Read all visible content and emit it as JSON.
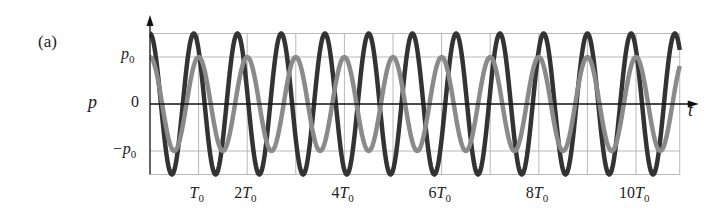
{
  "panel": {
    "label": "(a)"
  },
  "chart_data": {
    "type": "line",
    "title": "",
    "xlabel": "t",
    "ylabel": "p",
    "grid": true,
    "x_unit": "T0",
    "xlim": [
      0,
      10.9
    ],
    "ylim": [
      -1.5,
      1.5
    ],
    "x_ticks": [
      {
        "value": 1,
        "label": "T0"
      },
      {
        "value": 2,
        "label": "2T0"
      },
      {
        "value": 4,
        "label": "4T0"
      },
      {
        "value": 6,
        "label": "6T0"
      },
      {
        "value": 8,
        "label": "8T0"
      },
      {
        "value": 10,
        "label": "10T0"
      }
    ],
    "y_ticks": [
      {
        "value": 1,
        "label": "p0"
      },
      {
        "value": 0,
        "label": "0"
      },
      {
        "value": -1,
        "label": "-p0"
      }
    ],
    "series": [
      {
        "name": "dark wave",
        "color": "#333333",
        "amplitude": 1.5,
        "period": 0.9,
        "phase": 0,
        "formula": "1.5 p0 cos(2*pi*t/(0.9 T0))"
      },
      {
        "name": "light wave",
        "color": "#8a8a8a",
        "amplitude": 1.0,
        "period": 1.0,
        "phase": 0,
        "formula": "p0 cos(2*pi*t/T0)"
      }
    ]
  },
  "labels": {
    "ylabel": "p",
    "xlabel": "t",
    "y_p0": "p",
    "y_p0_sub": "0",
    "y_zero": "0",
    "y_neg_p0": "−p",
    "y_neg_p0_sub": "0",
    "x_ticks": [
      {
        "pre": "",
        "main": "T",
        "sub": "0"
      },
      {
        "pre": "2",
        "main": "T",
        "sub": "0"
      },
      {
        "pre": "4",
        "main": "T",
        "sub": "0"
      },
      {
        "pre": "6",
        "main": "T",
        "sub": "0"
      },
      {
        "pre": "8",
        "main": "T",
        "sub": "0"
      },
      {
        "pre": "10",
        "main": "T",
        "sub": "0"
      }
    ]
  }
}
